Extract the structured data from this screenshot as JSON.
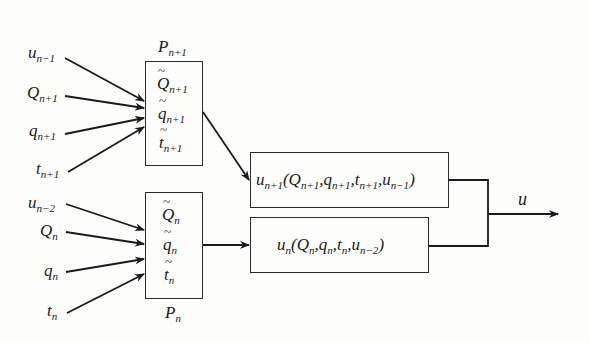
{
  "diagram": {
    "inputs_upper": [
      {
        "base": "u",
        "sub": "n−1"
      },
      {
        "base": "Q",
        "sub": "n+1"
      },
      {
        "base": "q",
        "sub": "n+1"
      },
      {
        "base": "t",
        "sub": "n+1"
      }
    ],
    "inputs_lower": [
      {
        "base": "u",
        "sub": "n−2"
      },
      {
        "base": "Q",
        "sub": "n"
      },
      {
        "base": "q",
        "sub": "n"
      },
      {
        "base": "t",
        "sub": "n"
      }
    ],
    "block_upper": {
      "label": {
        "base": "P",
        "sub": "n+1"
      },
      "items": [
        {
          "base": "Q",
          "sub": "n+1"
        },
        {
          "base": "q",
          "sub": "n+1"
        },
        {
          "base": "t",
          "sub": "n+1"
        }
      ]
    },
    "block_lower": {
      "label": {
        "base": "P",
        "sub": "n"
      },
      "items": [
        {
          "base": "Q",
          "sub": "n"
        },
        {
          "base": "q",
          "sub": "n"
        },
        {
          "base": "t",
          "sub": "n"
        }
      ]
    },
    "func_upper": {
      "u": "u",
      "u_sub": "n+1",
      "open": "(",
      "a1": "Q",
      "a1_sub": "n+1",
      "a2": "q",
      "a2_sub": "n+1",
      "a3": "t",
      "a3_sub": "n+1",
      "a4": "u",
      "a4_sub": "n−1",
      "close": ")",
      "sep": ","
    },
    "func_lower": {
      "u": "u",
      "u_sub": "n",
      "open": "(",
      "a1": "Q",
      "a1_sub": "n",
      "a2": "q",
      "a2_sub": "n",
      "a3": "t",
      "a3_sub": "n",
      "a4": "u",
      "a4_sub": "n−2",
      "close": ")",
      "sep": ","
    },
    "output": {
      "label": "u"
    }
  }
}
